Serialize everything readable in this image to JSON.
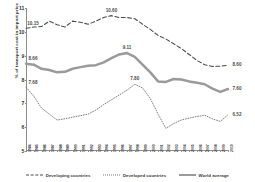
{
  "chart_data": {
    "type": "line",
    "title": "",
    "xlabel": "",
    "ylabel": "% of transport cost in import price",
    "ylim": [
      5,
      11
    ],
    "yticks": [
      5,
      6,
      7,
      8,
      9,
      10,
      11
    ],
    "grid": false,
    "legend_position": "bottom",
    "x": [
      1984,
      1985,
      1986,
      1987,
      1988,
      1989,
      1990,
      1991,
      1992,
      1993,
      1994,
      1995,
      1996,
      1997,
      1998,
      1999,
      2000,
      2001,
      2002,
      2003,
      2004,
      2005,
      2006,
      2007,
      2008,
      2009,
      2010
    ],
    "series": [
      {
        "name": "Developing countries",
        "style": "dashed",
        "color": "#4a4a4a",
        "values": [
          10.15,
          10.2,
          10.22,
          10.45,
          10.3,
          10.2,
          10.45,
          10.4,
          10.32,
          10.45,
          10.6,
          10.68,
          10.6,
          10.6,
          10.55,
          10.32,
          10.1,
          9.85,
          9.7,
          9.5,
          9.3,
          9.05,
          8.8,
          8.62,
          8.55,
          8.56,
          8.6
        ]
      },
      {
        "name": "Developed countries",
        "style": "dotted",
        "color": "#7a7a7a",
        "values": [
          7.68,
          7.3,
          6.8,
          6.55,
          6.3,
          6.35,
          6.42,
          6.48,
          6.55,
          6.72,
          6.95,
          7.15,
          7.35,
          7.55,
          7.8,
          7.65,
          7.2,
          6.55,
          5.95,
          6.15,
          6.3,
          6.38,
          6.45,
          6.5,
          6.35,
          6.24,
          6.52
        ]
      },
      {
        "name": "World average",
        "style": "solid",
        "color": "#9a9a9a",
        "values": [
          8.66,
          8.62,
          8.45,
          8.4,
          8.3,
          8.32,
          8.45,
          8.52,
          8.58,
          8.6,
          8.72,
          8.9,
          9.05,
          9.11,
          8.95,
          8.62,
          8.3,
          7.92,
          7.9,
          8.02,
          8.0,
          7.92,
          7.86,
          7.8,
          7.62,
          7.48,
          7.6
        ]
      }
    ],
    "data_labels": [
      {
        "series": "Developing countries",
        "x": 1984,
        "value": "10.15"
      },
      {
        "series": "Developing countries",
        "x": 1995,
        "value": "10.60"
      },
      {
        "series": "Developing countries",
        "x": 2010,
        "value": "8.60"
      },
      {
        "series": "World average",
        "x": 1984,
        "value": "8.66"
      },
      {
        "series": "World average",
        "x": 1997,
        "value": "9.11"
      },
      {
        "series": "World average",
        "x": 2010,
        "value": "7.60"
      },
      {
        "series": "Developed countries",
        "x": 1984,
        "value": "7.68"
      },
      {
        "series": "Developed countries",
        "x": 1998,
        "value": "7.80"
      },
      {
        "series": "Developed countries",
        "x": 2010,
        "value": "6.52"
      }
    ]
  }
}
